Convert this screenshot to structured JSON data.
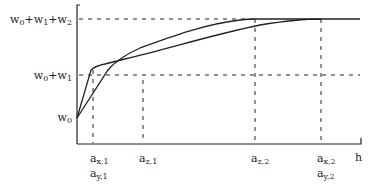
{
  "diagram": {
    "y_labels": {
      "top": {
        "base": "w",
        "parts": [
          [
            "w",
            "0"
          ],
          [
            "+w",
            "1"
          ],
          [
            "+w",
            "2"
          ]
        ]
      },
      "mid": {
        "parts": [
          [
            "w",
            "0"
          ],
          [
            "+w",
            "1"
          ]
        ]
      },
      "low": {
        "parts": [
          [
            "w",
            "0"
          ]
        ]
      }
    },
    "x_labels": [
      {
        "lines": [
          [
            "a",
            "x,1"
          ],
          [
            "a",
            "y,1"
          ]
        ]
      },
      {
        "lines": [
          [
            "a",
            "z,1"
          ]
        ]
      },
      {
        "lines": [
          [
            "a",
            "z,2"
          ]
        ]
      },
      {
        "lines": [
          [
            "a",
            "x,2"
          ],
          [
            "a",
            "y,2"
          ]
        ]
      }
    ],
    "x_axis_label": "h",
    "levels": {
      "w0": "w0",
      "w0_w1": "w0+w1",
      "w0_w1_w2": "w0+w1+w2"
    },
    "curves": [
      {
        "name": "piecewise-curve-xy",
        "description": "steep rise to a_x,1 then gradual to a_x,2"
      },
      {
        "name": "smooth-curve-z",
        "description": "rise from w0 through a_z,1 saturating at a_z,2"
      }
    ],
    "colors": {
      "line": "#222222",
      "background": "#ffffff"
    }
  }
}
